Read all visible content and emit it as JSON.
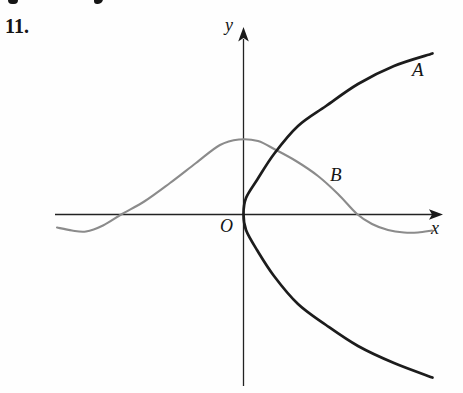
{
  "figure": {
    "problem_number": "11.",
    "labels": {
      "y_axis": "y",
      "x_axis": "x",
      "origin": "O",
      "curve_a": "A",
      "curve_b": "B"
    }
  },
  "chart_data": {
    "type": "line",
    "xlabel": "x",
    "ylabel": "y",
    "origin_label": "O",
    "axes_numeric_scale": false,
    "grid": false,
    "legend": "labels A and B placed beside the curves",
    "series": [
      {
        "name": "A",
        "description": "Thick black sideways-parabola-like curve opening to the right, vertical tangent at the origin, symmetric upper and lower branches",
        "color": "#1c1c1c",
        "stroke_width": 2.7,
        "points_px": [
          [
            432.5,
            53.5
          ],
          [
            394,
            66
          ],
          [
            358,
            84
          ],
          [
            326,
            106
          ],
          [
            298,
            126
          ],
          [
            274,
            154
          ],
          [
            257,
            180
          ],
          [
            246,
            198
          ],
          [
            243.5,
            214
          ],
          [
            246,
            230
          ],
          [
            257,
            250
          ],
          [
            274,
            276
          ],
          [
            298,
            304
          ],
          [
            326,
            325
          ],
          [
            358,
            346
          ],
          [
            394,
            363
          ],
          [
            432.5,
            377.5
          ]
        ]
      },
      {
        "name": "B",
        "description": "Gray bell-shaped curve: starts slightly below the x-axis at left, dips, rises to a flat peak just left of the y-axis, descends crossing the x-axis near the right, then levels off slightly below the axis",
        "color": "#8b8b8b",
        "stroke_width": 2.1,
        "points_px": [
          [
            57,
            227.5
          ],
          [
            72,
            230.5
          ],
          [
            86,
            231.5
          ],
          [
            103,
            225.5
          ],
          [
            122,
            214
          ],
          [
            145,
            201
          ],
          [
            170,
            183
          ],
          [
            196,
            163
          ],
          [
            220,
            145
          ],
          [
            239,
            139.5
          ],
          [
            258,
            141
          ],
          [
            276,
            150
          ],
          [
            296,
            161
          ],
          [
            318,
            176
          ],
          [
            338,
            194
          ],
          [
            357,
            214
          ],
          [
            372,
            224
          ],
          [
            388,
            230
          ],
          [
            404,
            232.5
          ],
          [
            418,
            232.5
          ],
          [
            432,
            230.5
          ]
        ]
      }
    ],
    "layout": {
      "canvas": {
        "width": 463,
        "height": 393
      },
      "x_axis_line": {
        "x1": 55,
        "y1": 214.5,
        "x2": 434,
        "y2": 214.5
      },
      "y_axis_line": {
        "x1": 243.5,
        "y1": 39,
        "x2": 243.5,
        "y2": 386
      },
      "x_arrowhead_points": "443,214.5 429,209.2 432,214.5 429,219.8",
      "y_arrowhead_points": "243.5,27 238.2,41.5 243.5,38 248.8,41.5",
      "axis_color": "#222222"
    }
  }
}
